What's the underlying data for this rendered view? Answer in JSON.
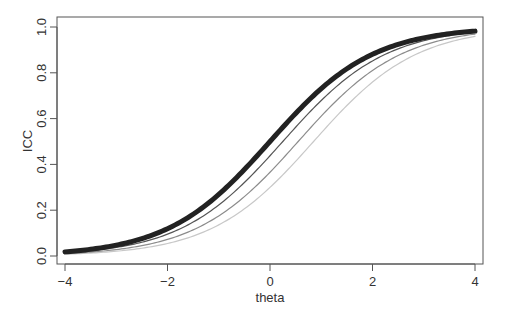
{
  "chart_data": {
    "type": "line",
    "title": "",
    "xlabel": "theta",
    "ylabel": "ICC",
    "xlim": [
      -4,
      4
    ],
    "ylim": [
      0,
      1
    ],
    "xticks": [
      -4,
      -2,
      0,
      2,
      4
    ],
    "xtick_labels": [
      "−4",
      "−2",
      "0",
      "2",
      "4"
    ],
    "yticks": [
      0.0,
      0.2,
      0.4,
      0.6,
      0.8,
      1.0
    ],
    "ytick_labels": [
      "0.0",
      "0.2",
      "0.4",
      "0.6",
      "0.8",
      "1.0"
    ],
    "grid": false,
    "legend": null,
    "model": "logistic P(theta) = 1 / (1 + exp(-(theta - b)))",
    "x": [
      -4,
      -3.5,
      -3,
      -2.5,
      -2,
      -1.5,
      -1,
      -0.5,
      0,
      0.5,
      1,
      1.5,
      2,
      2.5,
      3,
      3.5,
      4
    ],
    "series": [
      {
        "name": "curve-1",
        "b": 0.0,
        "color": "#222222",
        "width": 5,
        "values": [
          0.018,
          0.029,
          0.047,
          0.076,
          0.119,
          0.182,
          0.269,
          0.378,
          0.5,
          0.622,
          0.731,
          0.818,
          0.881,
          0.924,
          0.953,
          0.971,
          0.982
        ]
      },
      {
        "name": "curve-2",
        "b": 0.25,
        "color": "#555555",
        "width": 1.2,
        "values": [
          0.014,
          0.023,
          0.037,
          0.06,
          0.095,
          0.148,
          0.223,
          0.321,
          0.438,
          0.562,
          0.679,
          0.777,
          0.852,
          0.905,
          0.94,
          0.963,
          0.977
        ]
      },
      {
        "name": "curve-3",
        "b": 0.55,
        "color": "#8c8c8c",
        "width": 1.2,
        "values": [
          0.01,
          0.017,
          0.028,
          0.045,
          0.073,
          0.115,
          0.176,
          0.261,
          0.366,
          0.489,
          0.611,
          0.721,
          0.809,
          0.874,
          0.919,
          0.949,
          0.969
        ]
      },
      {
        "name": "curve-4",
        "b": 0.85,
        "color": "#c8c8c8",
        "width": 1.2,
        "values": [
          0.008,
          0.013,
          0.021,
          0.034,
          0.055,
          0.088,
          0.137,
          0.207,
          0.3,
          0.415,
          0.537,
          0.656,
          0.759,
          0.838,
          0.896,
          0.935,
          0.96
        ]
      }
    ]
  }
}
